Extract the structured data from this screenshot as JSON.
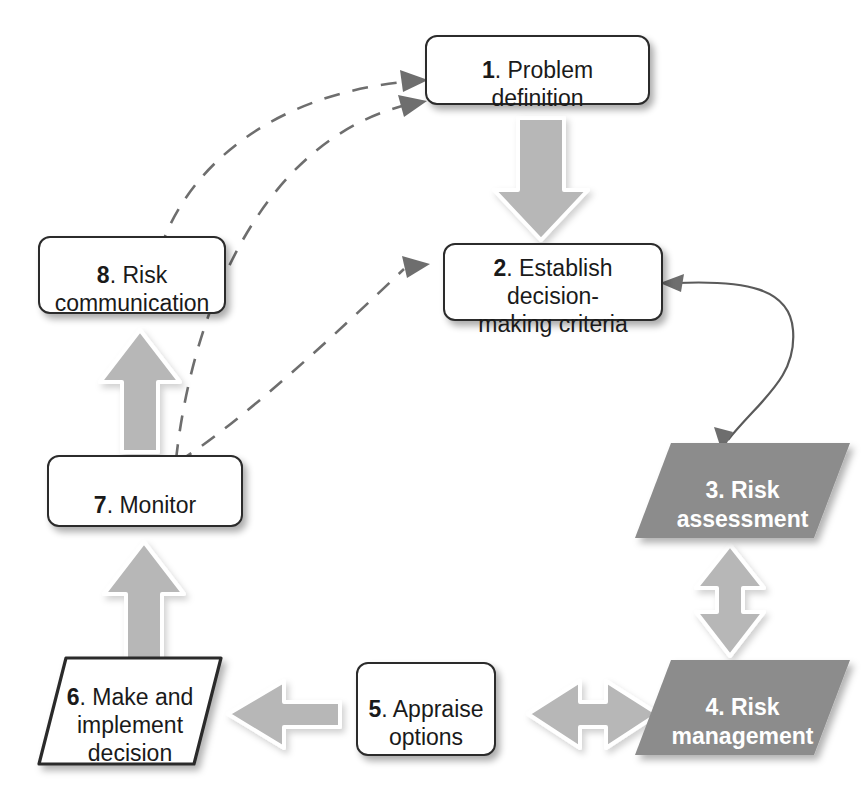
{
  "diagram": {
    "background_color": "#ffffff",
    "palette": {
      "box_fill": "#ffffff",
      "box_border": "#2b2b2b",
      "box_text": "#1a1a1a",
      "parallelogram_fill": "#8c8c8c",
      "parallelogram_text": "#ffffff",
      "block_arrow_fill": "#b7b7b7",
      "block_arrow_outline": "#ffffff",
      "dashed_line": "#6e6e6e",
      "thin_line": "#5a5a5a"
    },
    "nodes": [
      {
        "id": "n1",
        "number": "1",
        "label": ". Problem definition",
        "full_text": "1. Problem definition",
        "shape": "rounded-rectangle",
        "fill": "white"
      },
      {
        "id": "n2",
        "number": "2",
        "label": ". Establish decision-\nmaking criteria",
        "full_text": "2. Establish decision-making criteria",
        "shape": "rounded-rectangle",
        "fill": "white"
      },
      {
        "id": "n3",
        "number": "3",
        "label": ". Risk\nassessment",
        "full_text": "3. Risk assessment",
        "shape": "parallelogram",
        "fill": "gray"
      },
      {
        "id": "n4",
        "number": "4",
        "label": ". Risk\nmanagement",
        "full_text": "4. Risk management",
        "shape": "parallelogram",
        "fill": "gray"
      },
      {
        "id": "n5",
        "number": "5",
        "label": ". Appraise\noptions",
        "full_text": "5. Appraise options",
        "shape": "rounded-rectangle",
        "fill": "white"
      },
      {
        "id": "n6",
        "number": "6",
        "label": ". Make and\nimplement\ndecision",
        "full_text": "6. Make and implement decision",
        "shape": "parallelogram",
        "fill": "white"
      },
      {
        "id": "n7",
        "number": "7",
        "label": ". Monitor",
        "full_text": "7. Monitor",
        "shape": "rounded-rectangle",
        "fill": "white"
      },
      {
        "id": "n8",
        "number": "8",
        "label": ". Risk\ncommunication",
        "full_text": "8. Risk communication",
        "shape": "rounded-rectangle",
        "fill": "white"
      }
    ],
    "edges": [
      {
        "id": "e1",
        "from": "1",
        "to": "2",
        "style": "block-arrow",
        "direction": "down"
      },
      {
        "id": "e2",
        "from": "2",
        "to": "3",
        "style": "thin-curve",
        "direction": "bidirectional"
      },
      {
        "id": "e3",
        "from": "3",
        "to": "4",
        "style": "block-arrow",
        "direction": "bidirectional-vertical"
      },
      {
        "id": "e4",
        "from": "4",
        "to": "5",
        "style": "block-arrow",
        "direction": "bidirectional-horizontal"
      },
      {
        "id": "e5",
        "from": "5",
        "to": "6",
        "style": "block-arrow",
        "direction": "left"
      },
      {
        "id": "e6",
        "from": "6",
        "to": "7",
        "style": "block-arrow",
        "direction": "up"
      },
      {
        "id": "e7",
        "from": "7",
        "to": "8",
        "style": "block-arrow",
        "direction": "up"
      },
      {
        "id": "e8",
        "from": "8",
        "to": "1",
        "style": "dashed-curve",
        "direction": "to-node-1"
      },
      {
        "id": "e9",
        "from": "7",
        "to": "1",
        "style": "dashed-curve",
        "direction": "to-node-1"
      },
      {
        "id": "e10",
        "from": "7",
        "to": "2",
        "style": "dashed-curve",
        "direction": "to-node-2"
      }
    ]
  }
}
